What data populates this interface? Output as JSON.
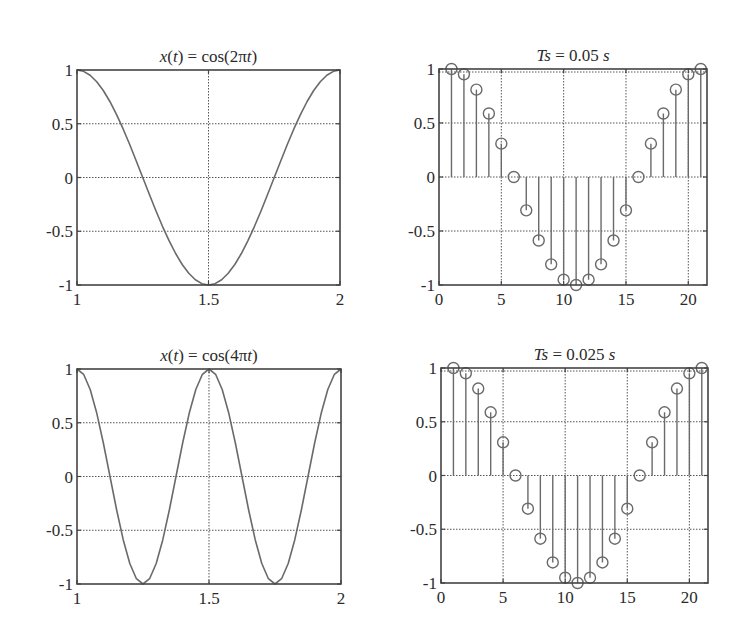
{
  "figure": {
    "width": 741,
    "height": 636,
    "colors": {
      "frame": "#444444",
      "curve": "#6a6a6a",
      "grid": "#555555",
      "text": "#2b2b2b",
      "background": "#ffffff"
    }
  },
  "chart_data": [
    {
      "id": "top-left",
      "type": "line",
      "title": "x(t) = cos(2πt)",
      "title_parts": [
        {
          "t": "x",
          "i": true
        },
        {
          "t": "(",
          "i": false
        },
        {
          "t": "t",
          "i": true
        },
        {
          "t": ") = cos(2π",
          "i": false
        },
        {
          "t": "t",
          "i": true
        },
        {
          "t": ")",
          "i": false
        }
      ],
      "xlabel": "",
      "ylabel": "",
      "xlim": [
        1,
        2
      ],
      "ylim": [
        -1,
        1
      ],
      "xticks": [
        1,
        1.5,
        2
      ],
      "xtick_labels": [
        "1",
        "1.5",
        "2"
      ],
      "yticks": [
        1,
        0.5,
        0,
        -0.5,
        -1
      ],
      "ytick_labels": [
        "1",
        "0.5",
        "0",
        "-0.5",
        "-1"
      ],
      "grid": true,
      "function": "cos(2*pi*t)",
      "freq_factor": 2,
      "sample_step": 0.025,
      "box": {
        "left": 77,
        "right": 340,
        "top": 70,
        "bottom": 285
      }
    },
    {
      "id": "top-right",
      "type": "stem",
      "title": "Ts = 0.05 s",
      "title_parts": [
        {
          "t": "Ts",
          "i": true
        },
        {
          "t": " = 0.05 ",
          "i": false
        },
        {
          "t": "s",
          "i": true
        }
      ],
      "xlabel": "",
      "ylabel": "",
      "xlim": [
        0,
        21.5
      ],
      "ylim": [
        -1,
        1
      ],
      "xticks": [
        0,
        5,
        10,
        15,
        20
      ],
      "xtick_labels": [
        "0",
        "5",
        "10",
        "15",
        "20"
      ],
      "yticks": [
        1,
        0.5,
        0,
        -0.5,
        -1
      ],
      "ytick_labels": [
        "1",
        "0.5",
        "0",
        "-0.5",
        "-1"
      ],
      "grid": true,
      "x": [
        1,
        2,
        3,
        4,
        5,
        6,
        7,
        8,
        9,
        10,
        11,
        12,
        13,
        14,
        15,
        16,
        17,
        18,
        19,
        20,
        21
      ],
      "values": [
        1,
        0.951,
        0.809,
        0.588,
        0.309,
        0,
        -0.309,
        -0.588,
        -0.809,
        -0.951,
        -1,
        -0.951,
        -0.809,
        -0.588,
        -0.309,
        0,
        0.309,
        0.588,
        0.809,
        0.951,
        1
      ],
      "box": {
        "left": 439,
        "right": 707,
        "top": 69,
        "bottom": 285
      }
    },
    {
      "id": "bottom-left",
      "type": "line",
      "title": "x(t) = cos(4πt)",
      "title_parts": [
        {
          "t": "x",
          "i": true
        },
        {
          "t": "(",
          "i": false
        },
        {
          "t": "t",
          "i": true
        },
        {
          "t": ") = cos(4π",
          "i": false
        },
        {
          "t": "t",
          "i": true
        },
        {
          "t": ")",
          "i": false
        }
      ],
      "xlabel": "",
      "ylabel": "",
      "xlim": [
        1,
        2
      ],
      "ylim": [
        -1,
        1
      ],
      "xticks": [
        1,
        1.5,
        2
      ],
      "xtick_labels": [
        "1",
        "1.5",
        "2"
      ],
      "yticks": [
        1,
        0.5,
        0,
        -0.5,
        -1
      ],
      "ytick_labels": [
        "1",
        "0.5",
        "0",
        "-0.5",
        "-1"
      ],
      "grid": true,
      "function": "cos(4*pi*t)",
      "freq_factor": 4,
      "sample_step": 0.025,
      "box": {
        "left": 77,
        "right": 341,
        "top": 369,
        "bottom": 584
      }
    },
    {
      "id": "bottom-right",
      "type": "stem",
      "title": "Ts = 0.025 s",
      "title_parts": [
        {
          "t": "Ts",
          "i": true
        },
        {
          "t": " = 0.025 ",
          "i": false
        },
        {
          "t": "s",
          "i": true
        }
      ],
      "xlabel": "",
      "ylabel": "",
      "xlim": [
        0,
        21.5
      ],
      "ylim": [
        -1,
        1
      ],
      "xticks": [
        0,
        5,
        10,
        15,
        20
      ],
      "xtick_labels": [
        "0",
        "5",
        "10",
        "15",
        "20"
      ],
      "yticks": [
        1,
        0.5,
        0,
        -0.5,
        -1
      ],
      "ytick_labels": [
        "1",
        "0.5",
        "0",
        "-0.5",
        "-1"
      ],
      "grid": true,
      "x": [
        1,
        2,
        3,
        4,
        5,
        6,
        7,
        8,
        9,
        10,
        11,
        12,
        13,
        14,
        15,
        16,
        17,
        18,
        19,
        20,
        21
      ],
      "values": [
        1,
        0.951,
        0.809,
        0.588,
        0.309,
        0,
        -0.309,
        -0.588,
        -0.809,
        -0.951,
        -1,
        -0.951,
        -0.809,
        -0.588,
        -0.309,
        0,
        0.309,
        0.588,
        0.809,
        0.951,
        1
      ],
      "box": {
        "left": 441,
        "right": 708,
        "top": 368,
        "bottom": 583
      }
    }
  ]
}
